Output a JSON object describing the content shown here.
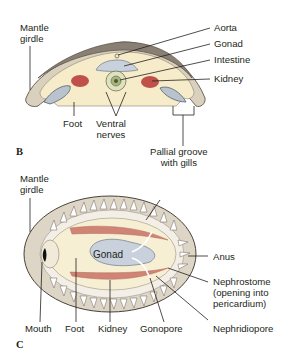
{
  "figure_b": {
    "panel_letter": "B",
    "labels": {
      "mantle_girdle": [
        "Mantle",
        "girdle"
      ],
      "aorta": "Aorta",
      "gonad": "Gonad",
      "intestine": "Intestine",
      "kidney": "Kidney",
      "foot": "Foot",
      "ventral_nerves": [
        "Ventral",
        "nerves"
      ],
      "pallial_groove": [
        "Pallial groove",
        "with gills"
      ]
    }
  },
  "figure_c": {
    "panel_letter": "C",
    "labels": {
      "mantle_girdle": [
        "Mantle",
        "girdle"
      ],
      "gonad": "Gonad",
      "anus": "Anus",
      "nephrostome": [
        "Nephrostome",
        "(opening into",
        "pericardium)"
      ],
      "mouth": "Mouth",
      "foot": "Foot",
      "kidney": "Kidney",
      "gonopore": "Gonopore",
      "nephridiopore": "Nephridiopore"
    }
  },
  "colors": {
    "body_fill": "#f7ecc9",
    "girdle_fill": "#d9d0bd",
    "shell_stroke": "#7a6f63",
    "kidney_red": "#c0514a",
    "gonad_blue": "#c9d2dc",
    "gill_blue": "#b9c3cd",
    "line": "#231f20"
  }
}
